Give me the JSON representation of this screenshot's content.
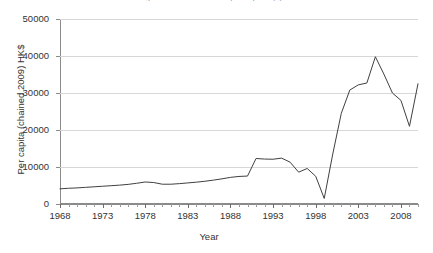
{
  "chart_data": {
    "type": "line",
    "title": "Figure: Real value added per capita by year",
    "xlabel": "Year",
    "ylabel": "Per capita (chained 2009) HK$",
    "xlim": [
      1968,
      2010
    ],
    "ylim": [
      0,
      50000
    ],
    "grid": true,
    "legend": "none",
    "y_ticks": [
      0,
      10000,
      20000,
      30000,
      40000,
      50000
    ],
    "y_tick_labels": [
      "0",
      "10000",
      "20000",
      "30000",
      "40000",
      "50000"
    ],
    "x_ticks": [
      1968,
      1973,
      1978,
      1983,
      1988,
      1993,
      1998,
      2003,
      2008
    ],
    "x_tick_labels": [
      "1968",
      "1973",
      "1978",
      "1983",
      "1988",
      "1993",
      "1998",
      "2003",
      "2008"
    ],
    "x_minor_tick_interval": 1,
    "line_color": "#404040",
    "series": [
      {
        "name": "Per capita value added",
        "x": [
          1968,
          1969,
          1970,
          1971,
          1972,
          1973,
          1974,
          1975,
          1976,
          1977,
          1978,
          1979,
          1980,
          1981,
          1982,
          1983,
          1984,
          1985,
          1986,
          1987,
          1988,
          1989,
          1990,
          1991,
          1992,
          1993,
          1994,
          1995,
          1996,
          1997,
          1998,
          1999,
          2000,
          2001,
          2002,
          2003,
          2004,
          2005,
          2006,
          2007,
          2008,
          2009,
          2010
        ],
        "values": [
          4100,
          4250,
          4350,
          4500,
          4650,
          4800,
          4950,
          5100,
          5300,
          5600,
          5950,
          5800,
          5350,
          5350,
          5500,
          5700,
          5900,
          6150,
          6450,
          6800,
          7200,
          7450,
          7550,
          12300,
          12150,
          12100,
          12400,
          11300,
          8600,
          9600,
          7500,
          1500,
          13500,
          24500,
          30800,
          32200,
          32700,
          39800,
          35100,
          30000,
          28000,
          21000,
          32500
        ]
      }
    ]
  },
  "axes": {
    "y_title": "Per capita (chained 2009) HK$",
    "x_title": "Year"
  }
}
